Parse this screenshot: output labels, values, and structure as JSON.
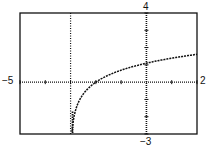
{
  "chart_data": {
    "type": "line",
    "title": "",
    "function": "y = ln(x + 3)",
    "xlim": [
      -5,
      2
    ],
    "ylim": [
      -3,
      4
    ],
    "xscale": 1,
    "yscale": 1,
    "xlabel": "",
    "ylabel": "",
    "window_labels": {
      "xmin": "−5",
      "xmax": "2",
      "ymax": "4",
      "ymin": "−3"
    },
    "asymptote_x": -3,
    "grid": false,
    "series": [
      {
        "name": "f(x)",
        "x": [
          -2.95,
          -2.9,
          -2.8,
          -2.6,
          -2.4,
          -2.2,
          -2.0,
          -1.5,
          -1.0,
          -0.5,
          0,
          0.5,
          1.0,
          1.5,
          2.0
        ],
        "values": [
          -3.0,
          -2.3,
          -1.61,
          -0.92,
          -0.51,
          -0.22,
          0.0,
          0.41,
          0.69,
          0.92,
          1.1,
          1.25,
          1.39,
          1.5,
          1.61
        ]
      }
    ]
  }
}
